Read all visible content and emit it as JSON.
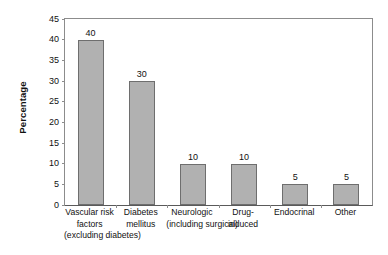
{
  "chart_data": {
    "type": "bar",
    "title": "",
    "xlabel": "",
    "ylabel": "Percentage",
    "ylim": [
      0,
      45
    ],
    "ytick_values": [
      45,
      40,
      35,
      30,
      25,
      20,
      15,
      10,
      5,
      0
    ],
    "ytick_labels": [
      "45",
      "40",
      "35",
      "30",
      "25",
      "20",
      "15",
      "10",
      "5",
      "0"
    ],
    "grid": false,
    "legend": false,
    "value_labels_shown": true,
    "categories": [
      "Vascular risk factors (excluding diabetes)",
      "Diabetes mellitus",
      "Neurologic (including surgical)",
      "Drug-induced",
      "Endocrinal",
      "Other"
    ],
    "category_label_lines": [
      [
        "Vascular risk",
        "factors",
        "(excluding diabetes)"
      ],
      [
        "Diabetes",
        "mellitus"
      ],
      [
        "Neurologic",
        "(including surgical)"
      ],
      [
        "Drug-",
        "induced"
      ],
      [
        "Endocrinal"
      ],
      [
        "Other"
      ]
    ],
    "values": [
      40,
      30,
      10,
      10,
      5,
      5
    ],
    "value_label_texts": [
      "40",
      "30",
      "10",
      "10",
      "5",
      "5"
    ],
    "colors": {
      "bar_fill": "#b1b1b1",
      "bar_stroke": "#6e6e6e",
      "axis": "#8c8c8c",
      "baseline": "#5a5a5a",
      "text": "#111111",
      "background": "#ffffff"
    }
  }
}
